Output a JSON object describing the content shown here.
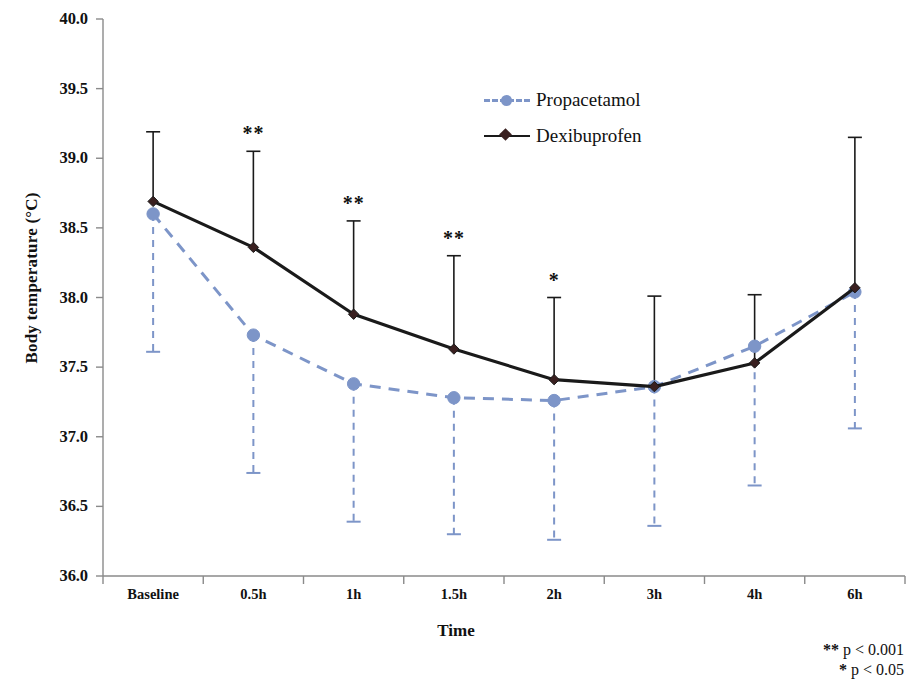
{
  "chart_data": {
    "type": "line",
    "title": "",
    "xlabel": "Time",
    "ylabel": "Body temperature (°C)",
    "categories": [
      "Baseline",
      "0.5h",
      "1h",
      "1.5h",
      "2h",
      "3h",
      "4h",
      "6h"
    ],
    "ylim": [
      36.0,
      40.0
    ],
    "ytick_labels": [
      "40.0",
      "39.5",
      "39.0",
      "38.5",
      "38.0",
      "37.5",
      "37.0",
      "36.5",
      "36.0"
    ],
    "ytick_values": [
      40.0,
      39.5,
      39.0,
      38.5,
      38.0,
      37.5,
      37.0,
      36.5,
      36.0
    ],
    "grid": false,
    "legend_position": "top-center-right",
    "series": [
      {
        "name": "Propacetamol",
        "color": "#7d95c8",
        "linestyle": "dashed",
        "marker": "circle",
        "values": [
          38.6,
          37.73,
          37.38,
          37.28,
          37.26,
          37.36,
          37.65,
          38.04
        ],
        "error_low": [
          37.61,
          36.74,
          36.39,
          36.3,
          36.26,
          36.36,
          36.65,
          37.06
        ]
      },
      {
        "name": "Dexibuprofen",
        "color": "#1a1a1a",
        "linestyle": "solid",
        "marker": "diamond",
        "values": [
          38.69,
          38.36,
          37.88,
          37.63,
          37.41,
          37.36,
          37.53,
          38.07
        ],
        "error_high": [
          39.19,
          39.05,
          38.55,
          38.3,
          38.0,
          38.01,
          38.02,
          39.15
        ]
      }
    ],
    "significance": [
      {
        "category": "0.5h",
        "label": "**"
      },
      {
        "category": "1h",
        "label": "**"
      },
      {
        "category": "1.5h",
        "label": "**"
      },
      {
        "category": "2h",
        "label": "*"
      }
    ],
    "annotations": [
      "** p < 0.001",
      "* p < 0.05"
    ]
  },
  "legend": {
    "items": [
      {
        "label": "Propacetamol"
      },
      {
        "label": "Dexibuprofen"
      }
    ]
  },
  "footnotes": {
    "lines": [
      {
        "stars": "**",
        "text": " p < 0.001"
      },
      {
        "stars": "*",
        "text": " p < 0.05"
      }
    ]
  },
  "axes": {
    "y_title": "Body temperature (°C)",
    "x_title": "Time"
  }
}
